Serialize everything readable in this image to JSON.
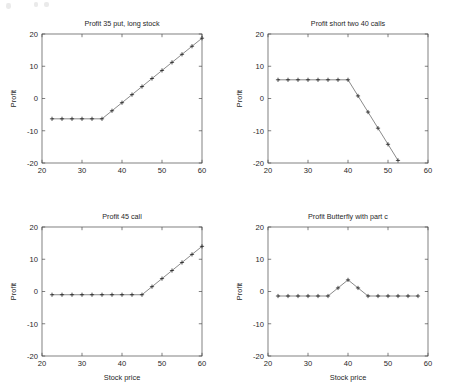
{
  "figure": {
    "title": "",
    "panel_count": 4,
    "background": "#ffffff",
    "line_color": "#3a3a3a",
    "axis_color": "#4a4a4a",
    "marker_symbol": "+"
  },
  "chart_data": [
    {
      "type": "line",
      "panel": "top-left",
      "title": "Profit 35 put, long stock",
      "xlabel": "",
      "ylabel": "Profit",
      "xlim": [
        20,
        60
      ],
      "ylim": [
        -20,
        20
      ],
      "xticks": [
        20,
        30,
        40,
        50,
        60
      ],
      "yticks": [
        -20,
        -10,
        0,
        10,
        20
      ],
      "grid": false,
      "legend": null,
      "marker": "+",
      "x": [
        22.5,
        25,
        27.5,
        30,
        32.5,
        35,
        37.5,
        40,
        42.5,
        45,
        47.5,
        50,
        52.5,
        55,
        57.5,
        60
      ],
      "y": [
        -6.3,
        -6.3,
        -6.3,
        -6.3,
        -6.3,
        -6.3,
        -3.8,
        -1.3,
        1.2,
        3.7,
        6.2,
        8.7,
        11.2,
        13.7,
        16.2,
        18.7
      ]
    },
    {
      "type": "line",
      "panel": "top-right",
      "title": "Profit short two 40 calls",
      "xlabel": "",
      "ylabel": "Profit",
      "xlim": [
        20,
        60
      ],
      "ylim": [
        -20,
        20
      ],
      "xticks": [
        20,
        30,
        40,
        50,
        60
      ],
      "yticks": [
        -20,
        -10,
        0,
        10,
        20
      ],
      "grid": false,
      "legend": null,
      "marker": "+",
      "x": [
        22.5,
        25,
        27.5,
        30,
        32.5,
        35,
        37.5,
        40,
        42.5,
        45,
        47.5,
        50,
        52.5
      ],
      "y": [
        5.8,
        5.8,
        5.8,
        5.8,
        5.8,
        5.8,
        5.8,
        5.8,
        0.8,
        -4.2,
        -9.2,
        -14.2,
        -19.2
      ]
    },
    {
      "type": "line",
      "panel": "bottom-left",
      "title": "Profit 45 call",
      "xlabel": "Stock price",
      "ylabel": "Profit",
      "xlim": [
        20,
        60
      ],
      "ylim": [
        -20,
        20
      ],
      "xticks": [
        20,
        30,
        40,
        50,
        60
      ],
      "yticks": [
        -20,
        -10,
        0,
        10,
        20
      ],
      "grid": false,
      "legend": null,
      "marker": "+",
      "x": [
        22.5,
        25,
        27.5,
        30,
        32.5,
        35,
        37.5,
        40,
        42.5,
        45,
        47.5,
        50,
        52.5,
        55,
        57.5,
        60
      ],
      "y": [
        -1.0,
        -1.0,
        -1.0,
        -1.0,
        -1.0,
        -1.0,
        -1.0,
        -1.0,
        -1.0,
        -1.0,
        1.5,
        4.0,
        6.5,
        9.0,
        11.5,
        14.0
      ]
    },
    {
      "type": "line",
      "panel": "bottom-right",
      "title": "Profit Butterfly with part c",
      "xlabel": "Stock price",
      "ylabel": "Profit",
      "xlim": [
        20,
        60
      ],
      "ylim": [
        -20,
        20
      ],
      "xticks": [
        20,
        30,
        40,
        50,
        60
      ],
      "yticks": [
        -20,
        -10,
        0,
        10,
        20
      ],
      "grid": false,
      "legend": null,
      "marker": "+",
      "x": [
        22.5,
        25,
        27.5,
        30,
        32.5,
        35,
        37.5,
        40,
        42.5,
        45,
        47.5,
        50,
        52.5,
        55,
        57.5
      ],
      "y": [
        -1.4,
        -1.4,
        -1.4,
        -1.4,
        -1.4,
        -1.4,
        1.1,
        3.6,
        1.1,
        -1.4,
        -1.4,
        -1.4,
        -1.4,
        -1.4,
        -1.4
      ]
    }
  ]
}
